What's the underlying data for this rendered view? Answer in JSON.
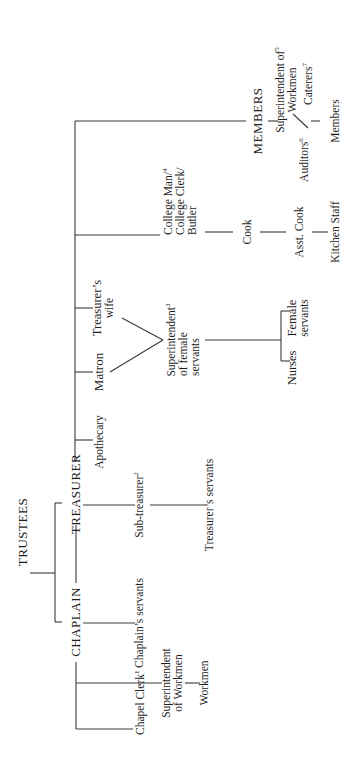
{
  "diagram": {
    "type": "organizational-chart",
    "orientation": "rotated-90-ccw",
    "nodes": {
      "trustees": "TRUSTEES",
      "chaplain": "CHAPLAIN",
      "treasurer": "TREASURER",
      "members": "MEMBERS",
      "chapel_clerk": "Chapel Clerk",
      "chapel_clerk_note": "1",
      "superintendent_workmen_l1": "Superintendent",
      "superintendent_workmen_l2": "of Workmen",
      "workmen": "Workmen",
      "chaplains_servants": "Chaplain’s servants",
      "sub_treasurer": "Sub-treasurer",
      "sub_treasurer_note": "2",
      "treasurers_servants": "Treasurer’s servants",
      "apothecary": "Apothecary",
      "matron": "Matron",
      "treasurers_wife_l1": "Treasurer’s",
      "treasurers_wife_l2": "wife",
      "superintendent_female_l1": "Superintendent",
      "superintendent_female_note": "3",
      "superintendent_female_l2": "of female",
      "superintendent_female_l3": "servants",
      "nurses": "Nurses",
      "female_servants_l1": "Female",
      "female_servants_l2": "servants",
      "college_man_l1": "College Man/",
      "college_man_note": "4",
      "college_man_l2": "College Clerk/",
      "college_man_l3": "Butler",
      "cook": "Cook",
      "asst_cook": "Asst. Cook",
      "kitchen_staff": "Kitchen Staff",
      "superintendent_members_l1": "Superintendent of",
      "superintendent_members_note": "5",
      "superintendent_members_l2": "Workmen",
      "auditors": "Auditors",
      "auditors_note": "6",
      "caterers": "Caterers",
      "caterers_note": "7",
      "members_leaf": "Members"
    },
    "edges": [
      [
        "TRUSTEES",
        "CHAPLAIN"
      ],
      [
        "TRUSTEES",
        "TREASURER"
      ],
      [
        "CHAPLAIN",
        "TREASURER"
      ],
      [
        "CHAPLAIN",
        "Chapel Clerk"
      ],
      [
        "CHAPLAIN",
        "Superintendent of Workmen"
      ],
      [
        "Superintendent of Workmen",
        "Workmen"
      ],
      [
        "CHAPLAIN",
        "Chaplain’s servants"
      ],
      [
        "TREASURER",
        "Sub-treasurer"
      ],
      [
        "Sub-treasurer",
        "Treasurer’s servants"
      ],
      [
        "TREASURER",
        "Apothecary"
      ],
      [
        "TREASURER",
        "Matron"
      ],
      [
        "TREASURER",
        "Treasurer’s wife"
      ],
      [
        "Matron",
        "Superintendent of female servants"
      ],
      [
        "Treasurer’s wife",
        "Superintendent of female servants"
      ],
      [
        "Superintendent of female servants",
        "Nurses"
      ],
      [
        "Superintendent of female servants",
        "Female servants"
      ],
      [
        "TREASURER",
        "College Man/College Clerk/Butler"
      ],
      [
        "College Man/College Clerk/Butler",
        "Cook"
      ],
      [
        "Cook",
        "Asst. Cook"
      ],
      [
        "Asst. Cook",
        "Kitchen Staff"
      ],
      [
        "TREASURER",
        "MEMBERS"
      ],
      [
        "MEMBERS",
        "Superintendent of Workmen (5)"
      ],
      [
        "MEMBERS",
        "Auditors"
      ],
      [
        "Superintendent of Workmen (5)",
        "Auditors"
      ],
      [
        "MEMBERS",
        "Caterers"
      ],
      [
        "Caterers",
        "Members"
      ]
    ],
    "colors": {
      "line": "#3a3a3a",
      "text": "#1e1e1e",
      "background": "#ffffff"
    }
  }
}
